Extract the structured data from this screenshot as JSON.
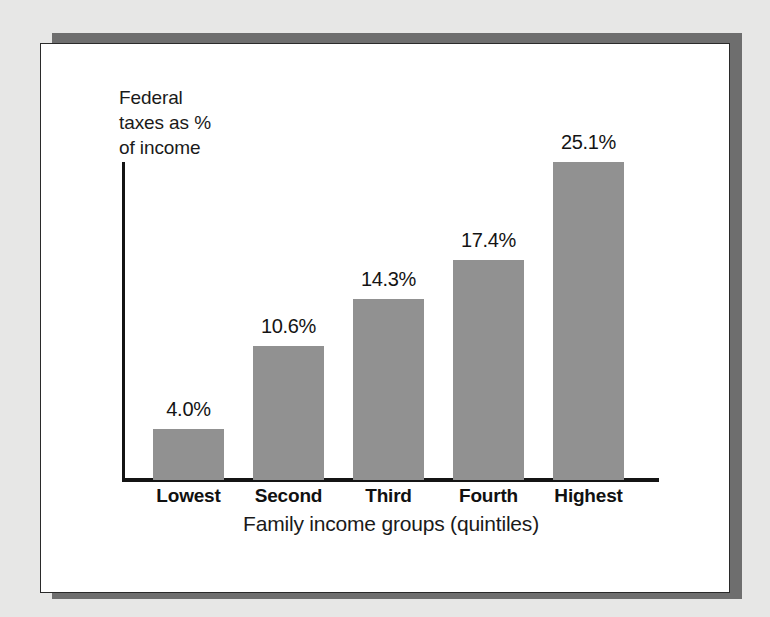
{
  "figure": {
    "panel_background": "#ffffff",
    "page_background": "#e7e7e6",
    "shadow_color": "#6e6e6e",
    "border_color": "#2a2a2a"
  },
  "chart_data": {
    "type": "bar",
    "title": "",
    "subtitle": "",
    "xlabel": "Family income groups (quintiles)",
    "ylabel": "Federal\ntaxes as %\nof income",
    "categories": [
      "Lowest",
      "Second",
      "Third",
      "Fourth",
      "Highest"
    ],
    "values": [
      4.0,
      10.6,
      14.3,
      17.4,
      25.1
    ],
    "value_labels": [
      "4.0%",
      "10.6%",
      "14.3%",
      "17.4%",
      "25.1%"
    ],
    "series": [
      {
        "name": "Federal taxes as % of income",
        "values": [
          4.0,
          10.6,
          14.3,
          17.4,
          25.1
        ]
      }
    ],
    "ylim": [
      0,
      26
    ],
    "grid": false,
    "legend": "none",
    "bar_color": "#919191",
    "axis_color": "#141414",
    "axis_ticks_shown": false
  }
}
